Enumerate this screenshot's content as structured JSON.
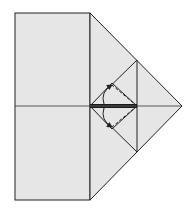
{
  "diagram": {
    "type": "origami-fold-step",
    "paper_color": "#e6e6e6",
    "line_color": "#222222",
    "background": "#ffffff",
    "annotations": [
      {
        "kind": "valley-fold-dashed",
        "direction": "up"
      },
      {
        "kind": "valley-fold-dashed",
        "direction": "down"
      },
      {
        "kind": "fold-arrow",
        "direction": "up"
      },
      {
        "kind": "fold-arrow",
        "direction": "down"
      }
    ]
  }
}
